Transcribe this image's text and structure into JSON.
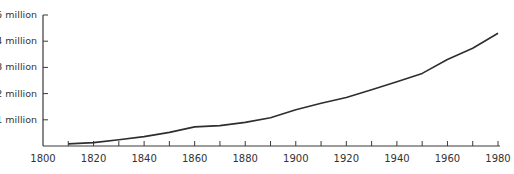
{
  "chart_data": {
    "type": "line",
    "title": "",
    "xlabel": "",
    "ylabel": "",
    "x": [
      1810,
      1820,
      1830,
      1840,
      1850,
      1860,
      1870,
      1880,
      1890,
      1900,
      1910,
      1920,
      1930,
      1940,
      1950,
      1960,
      1970,
      1980
    ],
    "series": [
      {
        "name": "Population",
        "values": [
          0.08,
          0.13,
          0.24,
          0.36,
          0.52,
          0.73,
          0.78,
          0.9,
          1.08,
          1.38,
          1.63,
          1.85,
          2.15,
          2.45,
          2.77,
          3.3,
          3.73,
          4.3
        ]
      }
    ],
    "xlim": [
      1800,
      1980
    ],
    "ylim": [
      0,
      5
    ],
    "x_ticks_minor": [
      1810,
      1820,
      1830,
      1840,
      1850,
      1860,
      1870,
      1880,
      1890,
      1900,
      1910,
      1920,
      1930,
      1940,
      1950,
      1960,
      1970,
      1980
    ],
    "x_tick_labels": [
      "1800",
      "1820",
      "1840",
      "1860",
      "1880",
      "1900",
      "1920",
      "1940",
      "1960",
      "1980"
    ],
    "y_tick_labels": [
      "1 million",
      "2 million",
      "3 million",
      "4 million",
      "5 million"
    ],
    "grid": false,
    "legend": "none"
  },
  "axes": {
    "y_labels": [
      "1 million",
      "2 million",
      "3 million",
      "4 million",
      "5 million"
    ],
    "x_labels": [
      "1800",
      "1820",
      "1840",
      "1860",
      "1880",
      "1900",
      "1920",
      "1940",
      "1960",
      "1980"
    ]
  },
  "colors": {
    "line": "#2e2e2e",
    "axis": "#3a3a3a",
    "text": "#333333"
  }
}
